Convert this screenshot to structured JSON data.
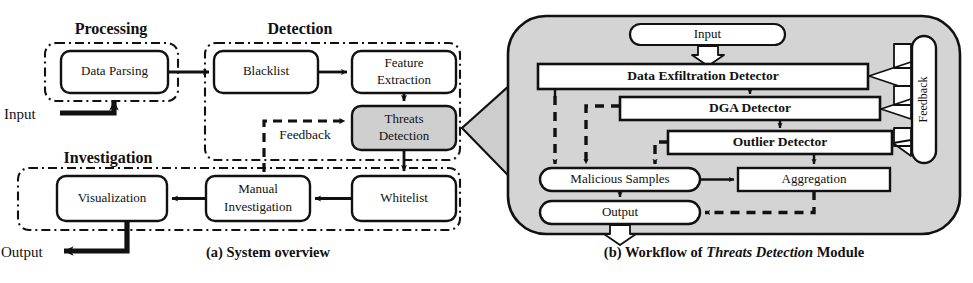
{
  "figure": {
    "panel_a": {
      "caption": "(a) System overview",
      "groups": [
        {
          "id": "processing",
          "title": "Processing"
        },
        {
          "id": "detection",
          "title": "Detection"
        },
        {
          "id": "investigation",
          "title": "Investigation"
        }
      ],
      "nodes": [
        {
          "id": "data-parsing",
          "label": "Data Parsing",
          "lines": [
            "Data Parsing"
          ],
          "highlight": false
        },
        {
          "id": "blacklist",
          "label": "Blacklist",
          "lines": [
            "Blacklist"
          ],
          "highlight": false
        },
        {
          "id": "feature-extraction",
          "label": "Feature Extraction",
          "lines": [
            "Feature",
            "Extraction"
          ],
          "highlight": false
        },
        {
          "id": "threats-detection",
          "label": "Threats Detection",
          "lines": [
            "Threats",
            "Detection"
          ],
          "highlight": true
        },
        {
          "id": "whitelist",
          "label": "Whitelist",
          "lines": [
            "Whitelist"
          ],
          "highlight": false
        },
        {
          "id": "manual-investigation",
          "label": "Manual Investigation",
          "lines": [
            "Manual",
            "Investigation"
          ],
          "highlight": false
        },
        {
          "id": "visualization",
          "label": "Visualization",
          "lines": [
            "Visualization"
          ],
          "highlight": false
        }
      ],
      "edge_labels": [
        {
          "id": "feedback",
          "label": "Feedback",
          "style": "dashed"
        }
      ],
      "io": [
        {
          "id": "input",
          "label": "Input"
        },
        {
          "id": "output",
          "label": "Output"
        }
      ]
    },
    "panel_b": {
      "caption_prefix": "(b) Workflow of ",
      "caption_italic": "Threats Detection",
      "caption_suffix": " Module",
      "nodes": [
        {
          "id": "input",
          "label": "Input",
          "shape": "stadium",
          "bold": false
        },
        {
          "id": "data-exfiltration-detector",
          "label": "Data Exfiltration Detector",
          "shape": "rect",
          "bold": true
        },
        {
          "id": "dga-detector",
          "label": "DGA Detector",
          "shape": "rect",
          "bold": true
        },
        {
          "id": "outlier-detector",
          "label": "Outlier Detector",
          "shape": "rect",
          "bold": true
        },
        {
          "id": "malicious-samples",
          "label": "Malicious Samples",
          "shape": "stadium",
          "bold": false
        },
        {
          "id": "aggregation",
          "label": "Aggregation",
          "shape": "rect",
          "bold": false
        },
        {
          "id": "output",
          "label": "Output",
          "shape": "stadium",
          "bold": false
        },
        {
          "id": "feedback",
          "label": "Feedback",
          "shape": "stadium-v",
          "bold": false
        }
      ]
    },
    "colors": {
      "stroke": "#111111",
      "panel_fill": "#d4d4d4",
      "highlight_fill": "#cfcfcf",
      "node_fill": "#ffffff",
      "callout_fill": "#cdcdcd"
    }
  }
}
